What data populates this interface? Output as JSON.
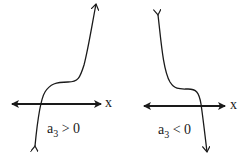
{
  "panels": [
    {
      "axis_label": "x",
      "condition": {
        "base": "a",
        "sub": "3",
        "rel": " > 0"
      }
    },
    {
      "axis_label": "x",
      "condition": {
        "base": "a",
        "sub": "3",
        "rel": " < 0"
      }
    }
  ],
  "colors": {
    "ink": "#1a1a1a",
    "background": "#ffffff"
  }
}
